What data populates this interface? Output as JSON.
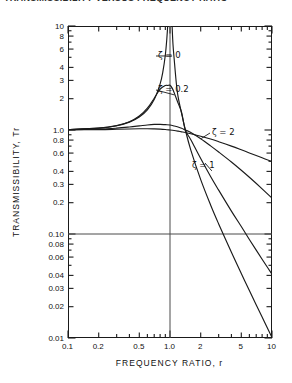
{
  "figure": {
    "top_caption": "TRANSMISSIBILITY VERSUS FREQUENCY RATIO",
    "zeta_symbol": "ζ"
  },
  "chart_data": {
    "type": "line",
    "title": "",
    "xlabel": "FREQUENCY  RATIO,  r",
    "ylabel": "TRANSMISSIBILITY,  Tr",
    "xscale": "log",
    "yscale": "log",
    "xlim": [
      0.1,
      10
    ],
    "ylim": [
      0.01,
      10
    ],
    "grid": false,
    "legend_position": "inline-annotations",
    "xtick_labels": [
      "0.1",
      "0.2",
      "0.5",
      "1.0",
      "2",
      "5",
      "10"
    ],
    "xtick_values": [
      0.1,
      0.2,
      0.5,
      1.0,
      2,
      5,
      10
    ],
    "ytick_labels": [
      "10",
      "8",
      "6",
      "4",
      "3",
      "2",
      "1.0",
      "0.8",
      "0.6",
      "0.4",
      "0.3",
      "0.2",
      "0.10",
      "0.08",
      "0.06",
      "0.04",
      "0.03",
      "0.02",
      "0.01"
    ],
    "ytick_values": [
      10,
      8,
      6,
      4,
      3,
      2,
      1.0,
      0.8,
      0.6,
      0.4,
      0.3,
      0.2,
      0.1,
      0.08,
      0.06,
      0.04,
      0.03,
      0.02,
      0.01
    ],
    "reference_lines": [
      {
        "name": "transmissibility-0p10-line",
        "orientation": "horizontal",
        "value": 0.1
      },
      {
        "name": "frequency-ratio-1p0-line",
        "orientation": "vertical",
        "value": 1.0
      }
    ],
    "crossover_point": {
      "r": 1.414,
      "Tr": 1.0
    },
    "series": [
      {
        "name": "ζ = 0",
        "zeta": 0,
        "annotation": "ζ = 0",
        "x": [
          0.1,
          0.2,
          0.3,
          0.4,
          0.5,
          0.6,
          0.7,
          0.8,
          0.85,
          0.9,
          0.93,
          0.95,
          0.97,
          0.98,
          0.99,
          1.01,
          1.02,
          1.03,
          1.05,
          1.07,
          1.1,
          1.15,
          1.2,
          1.3,
          1.414,
          1.6,
          2.0,
          2.5,
          3.0,
          4.0,
          5.0,
          6.0,
          8.0,
          10.0
        ],
        "y": [
          1.01,
          1.042,
          1.099,
          1.19,
          1.333,
          1.563,
          1.961,
          2.778,
          3.604,
          5.263,
          7.452,
          10.26,
          16.92,
          25.25,
          50.25,
          49.75,
          24.75,
          16.42,
          9.756,
          6.63,
          4.762,
          2.899,
          2.091,
          1.439,
          1.0,
          0.641,
          0.333,
          0.19,
          0.125,
          0.0667,
          0.0417,
          0.0286,
          0.0159,
          0.0101
        ]
      },
      {
        "name": "ζ = 0.2",
        "zeta": 0.2,
        "annotation": "ζ = 0.2",
        "x": [
          0.1,
          0.2,
          0.3,
          0.4,
          0.5,
          0.6,
          0.7,
          0.8,
          0.9,
          0.95,
          1.0,
          1.05,
          1.1,
          1.2,
          1.3,
          1.414,
          1.6,
          2.0,
          2.5,
          3.0,
          4.0,
          5.0,
          6.0,
          8.0,
          10.0
        ],
        "y": [
          1.01,
          1.043,
          1.103,
          1.201,
          1.361,
          1.622,
          2.022,
          2.471,
          2.682,
          2.68,
          2.693,
          2.527,
          2.276,
          1.814,
          1.474,
          1.0,
          0.806,
          0.531,
          0.357,
          0.264,
          0.166,
          0.118,
          0.0886,
          0.0571,
          0.0411
        ]
      },
      {
        "name": "ζ = 1",
        "zeta": 1,
        "annotation": "ζ = 1",
        "x": [
          0.1,
          0.2,
          0.3,
          0.4,
          0.5,
          0.6,
          0.7,
          0.8,
          0.9,
          1.0,
          1.1,
          1.2,
          1.3,
          1.414,
          1.6,
          2.0,
          2.5,
          3.0,
          4.0,
          5.0,
          6.0,
          8.0,
          10.0
        ],
        "y": [
          1.005,
          1.019,
          1.041,
          1.068,
          1.095,
          1.118,
          1.131,
          1.133,
          1.125,
          1.118,
          1.094,
          1.069,
          1.04,
          1.0,
          0.947,
          0.825,
          0.704,
          0.614,
          0.492,
          0.41,
          0.351,
          0.272,
          0.221
        ]
      },
      {
        "name": "ζ = 2",
        "zeta": 2,
        "annotation": "ζ = 2",
        "x": [
          0.1,
          0.2,
          0.3,
          0.4,
          0.5,
          0.6,
          0.7,
          0.8,
          0.9,
          1.0,
          1.1,
          1.2,
          1.3,
          1.414,
          1.6,
          2.0,
          2.5,
          3.0,
          4.0,
          5.0,
          6.0,
          8.0,
          10.0
        ],
        "y": [
          1.002,
          1.008,
          1.016,
          1.023,
          1.027,
          1.028,
          1.025,
          1.02,
          1.012,
          1.0,
          0.988,
          0.974,
          0.96,
          0.945,
          0.92,
          0.87,
          0.818,
          0.772,
          0.7,
          0.645,
          0.602,
          0.54,
          0.497
        ]
      }
    ]
  },
  "annotations": [
    {
      "name": "annotation-zeta-0",
      "label": "ζ = 0",
      "x": 158,
      "y": 56
    },
    {
      "name": "annotation-zeta-0p2",
      "label": "ζ = 0.2",
      "x": 158,
      "y": 90
    },
    {
      "name": "annotation-zeta-2",
      "label": "ζ = 2",
      "x": 212,
      "y": 133
    },
    {
      "name": "annotation-zeta-1",
      "label": "ζ = 1",
      "x": 192,
      "y": 166
    }
  ],
  "colors": {
    "ink": "#1a1a1a",
    "curve": "#1a1a1a",
    "reference_line": "#4a4a4a",
    "background": "#ffffff"
  }
}
